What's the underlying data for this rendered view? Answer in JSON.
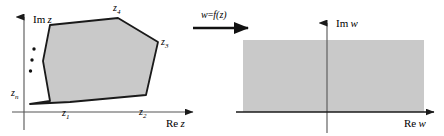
{
  "figure": {
    "background_color": "#ffffff",
    "stroke_color": "#1a1a1a",
    "fill_color": "#c9c9c9",
    "width": 444,
    "height": 136
  },
  "left_panel": {
    "name": "z-plane",
    "axes": {
      "imaginary_label_prefix": "Im",
      "imaginary_label_var": "z",
      "real_label_prefix": "Re",
      "real_label_var": "z",
      "vertical_axis_x": 24,
      "vertical_axis_top": 14,
      "vertical_axis_bottom": 130,
      "horizontal_axis_y": 112,
      "horizontal_axis_left": 12,
      "horizontal_axis_right": 196
    },
    "polygon": {
      "fill": "#c9c9c9",
      "stroke": "#1a1a1a",
      "stroke_width": 1.8,
      "points": "30,104 50,101 43,61 50,25 118,18 158,42 146,95 70,102"
    },
    "continuation_dots": [
      {
        "cx": 34,
        "cy": 49
      },
      {
        "cx": 32,
        "cy": 59
      },
      {
        "cx": 30,
        "cy": 70
      }
    ],
    "vertex_labels": [
      {
        "id": "z1",
        "base": "z",
        "sub": "1",
        "x": 62,
        "y": 108
      },
      {
        "id": "z2",
        "base": "z",
        "sub": "2",
        "x": 140,
        "y": 107
      },
      {
        "id": "z3",
        "base": "z",
        "sub": "3",
        "x": 160,
        "y": 41
      },
      {
        "id": "z4",
        "base": "z",
        "sub": "4",
        "x": 113,
        "y": 3
      },
      {
        "id": "zn",
        "base": "z",
        "sub": "n",
        "x": 12,
        "y": 89
      }
    ]
  },
  "mapping_arrow": {
    "label_w": "w",
    "label_equals": "=",
    "label_f": "f",
    "label_arg": "(z)",
    "label_full": "w=f(z)",
    "x_start": 193,
    "x_end": 252,
    "y": 27,
    "label_x": 201,
    "label_y": 10
  },
  "right_panel": {
    "name": "w-plane",
    "axes": {
      "imaginary_label_prefix": "Im",
      "imaginary_label_var": "w",
      "real_label_prefix": "Re",
      "real_label_var": "w",
      "vertical_axis_x": 327,
      "vertical_axis_top": 20,
      "vertical_axis_bottom": 133,
      "horizontal_axis_y": 112,
      "horizontal_axis_left": 236,
      "horizontal_axis_right": 437
    },
    "region": {
      "fill": "#c9c9c9",
      "x": 243,
      "y": 40,
      "width": 181,
      "height": 72
    }
  }
}
